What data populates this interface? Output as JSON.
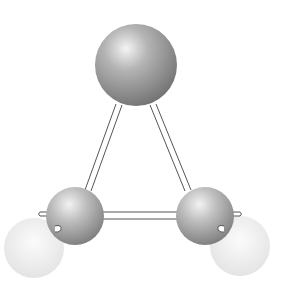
{
  "diagram": {
    "type": "ball-and-stick molecular model",
    "background": "#ffffff",
    "atoms": [
      {
        "id": "top",
        "cx": 136,
        "cy": 65,
        "r": 41,
        "shade": "#8a8a8a",
        "highlight": "#f2f2f2",
        "opacity": 1
      },
      {
        "id": "bottom-left",
        "cx": 75,
        "cy": 216,
        "r": 29,
        "shade": "#8f8f8f",
        "highlight": "#f0f0f0",
        "opacity": 1
      },
      {
        "id": "bottom-right",
        "cx": 205,
        "cy": 216,
        "r": 29,
        "shade": "#8f8f8f",
        "highlight": "#f0f0f0",
        "opacity": 1
      },
      {
        "id": "faint-left",
        "cx": 34,
        "cy": 248,
        "r": 30,
        "shade": "#e2e2e2",
        "highlight": "#fafafa",
        "opacity": 1
      },
      {
        "id": "faint-right",
        "cx": 240,
        "cy": 246,
        "r": 30,
        "shade": "#e2e2e2",
        "highlight": "#fafafa",
        "opacity": 1
      }
    ],
    "bonds": [
      {
        "from": "top",
        "to": "bottom-left",
        "x1": 118,
        "y1": 104,
        "x2": 88,
        "y2": 190
      },
      {
        "from": "top",
        "to": "bottom-right",
        "x1": 153,
        "y1": 104,
        "x2": 188,
        "y2": 190
      },
      {
        "from": "bottom-left",
        "to": "bottom-right",
        "x1": 102,
        "y1": 216,
        "x2": 178,
        "y2": 216
      }
    ]
  }
}
